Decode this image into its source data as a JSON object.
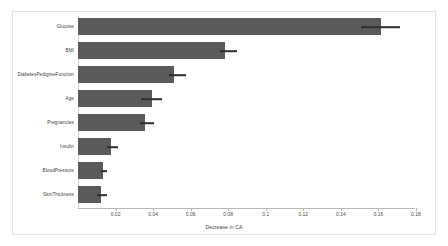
{
  "chart_data": {
    "type": "bar",
    "orientation": "horizontal",
    "title": "",
    "xlabel": "Decrease in CA",
    "ylabel": "",
    "categories": [
      "Glucose",
      "BMI",
      "DiabetesPedigreeFunction",
      "Age",
      "Pregnancies",
      "Insulin",
      "BloodPressure",
      "SkinThickness"
    ],
    "values": [
      0.1612,
      0.0782,
      0.0511,
      0.0394,
      0.0356,
      0.0176,
      0.0133,
      0.0122
    ],
    "errors_low": [
      0.1506,
      0.0755,
      0.0484,
      0.0335,
      0.0329,
      0.0154,
      0.0122,
      0.0101
    ],
    "errors_high": [
      0.1713,
      0.0846,
      0.0574,
      0.0447,
      0.0404,
      0.0213,
      0.0154,
      0.0154
    ],
    "xticks": [
      "0.02",
      "0.04",
      "0.06",
      "0.08",
      "0.1",
      "0.12",
      "0.14",
      "0.16",
      "0.18"
    ],
    "xtick_values": [
      0.02,
      0.04,
      0.06,
      0.08,
      0.1,
      0.12,
      0.14,
      0.16,
      0.18
    ],
    "xlim": [
      0,
      0.1795
    ],
    "grid": false,
    "legend": null,
    "bar_color": "#5a5a5a",
    "error_color": "#2f2f2f",
    "axis_color": "#b8b8b8",
    "background": "#ffffff"
  }
}
